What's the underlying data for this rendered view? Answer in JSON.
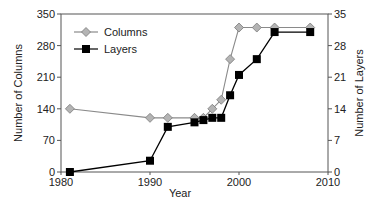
{
  "chart_data": {
    "type": "line",
    "title": "",
    "xlabel": "Year",
    "ylabel": "Number of Columns",
    "y2label": "Number of Layers",
    "xlim": [
      1980,
      2010
    ],
    "ylim": [
      0,
      350
    ],
    "y2lim": [
      0,
      35
    ],
    "xticks": [
      1980,
      1990,
      2000,
      2010
    ],
    "yticks": [
      0,
      70,
      140,
      210,
      280,
      350
    ],
    "y2ticks": [
      0,
      7,
      14,
      21,
      28,
      35
    ],
    "grid": false,
    "legend_position": "upper left",
    "series": [
      {
        "name": "Columns",
        "axis": "left",
        "marker": "diamond",
        "line_color": "#8a8a8a",
        "marker_fill": "#b4b4b4",
        "marker_stroke": "#7a7a7a",
        "x": [
          1981,
          1990,
          1992,
          1995,
          1996,
          1997,
          1998,
          1999,
          2000,
          2002,
          2004,
          2008
        ],
        "values": [
          140,
          120,
          120,
          120,
          120,
          140,
          160,
          250,
          320,
          320,
          320,
          320
        ]
      },
      {
        "name": "Layers",
        "axis": "right",
        "marker": "square",
        "line_color": "#000000",
        "marker_fill": "#000000",
        "marker_stroke": "#000000",
        "x": [
          1981,
          1990,
          1992,
          1995,
          1996,
          1997,
          1998,
          1999,
          2000,
          2002,
          2004,
          2008
        ],
        "values": [
          0,
          2.5,
          10,
          11,
          11.5,
          12,
          12,
          17,
          21.5,
          25,
          31,
          31
        ]
      }
    ]
  },
  "legend": {
    "items": [
      {
        "label": "Columns"
      },
      {
        "label": "Layers"
      }
    ]
  },
  "axes": {
    "x_title": "Year",
    "y_left_title": "Number of Columns",
    "y_right_title": "Number of Layers"
  }
}
